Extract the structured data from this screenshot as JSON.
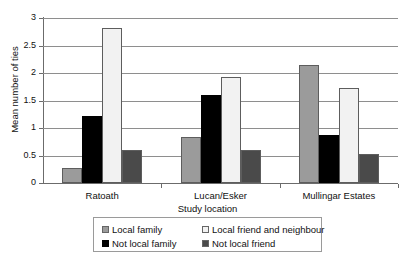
{
  "chart_data": {
    "type": "bar",
    "title": "",
    "xlabel": "Study location",
    "ylabel": "Mean number of ties",
    "categories": [
      "Ratoath",
      "Lucan/Esker",
      "Mullingar Estates"
    ],
    "ylim": [
      0,
      3
    ],
    "yticks": [
      "0",
      "0.5",
      "1",
      "1.5",
      "2",
      "2.5",
      "3"
    ],
    "ytick_values": [
      0,
      0.5,
      1,
      1.5,
      2,
      2.5,
      3
    ],
    "grid": true,
    "legend_position": "bottom",
    "series": [
      {
        "name": "Local family",
        "color": "#9b9b9b",
        "values": [
          0.28,
          0.83,
          2.15
        ]
      },
      {
        "name": "Not local family",
        "color": "#000000",
        "values": [
          1.22,
          1.6,
          0.87
        ]
      },
      {
        "name": "Local friend and neighbour",
        "color": "#f2f2f2",
        "values": [
          2.82,
          1.93,
          1.73
        ]
      },
      {
        "name": "Not local friend",
        "color": "#4a4a4a",
        "values": [
          0.6,
          0.6,
          0.53
        ]
      }
    ],
    "legend_order": [
      "Local family",
      "Local friend and neighbour",
      "Not local family",
      "Not local friend"
    ]
  }
}
